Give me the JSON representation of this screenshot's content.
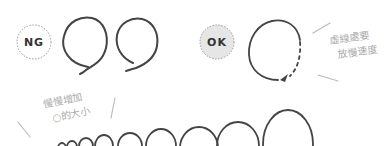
{
  "ng_example": {
    "badge": "NG",
    "badge_style": "dotted-circle-white"
  },
  "ok_example": {
    "badge": "OK",
    "badge_style": "dotted-circle-gray",
    "note_line1": "虛線處要",
    "note_line2": "放慢速度"
  },
  "growth_example": {
    "note_line1": "慢慢增加",
    "note_line2": "○的大小",
    "loop_count": 8
  },
  "colors": {
    "stroke": "#444444",
    "note_text": "#aaaaaa",
    "badge_ok_fill": "#e6e6e6",
    "badge_border": "#999999"
  }
}
